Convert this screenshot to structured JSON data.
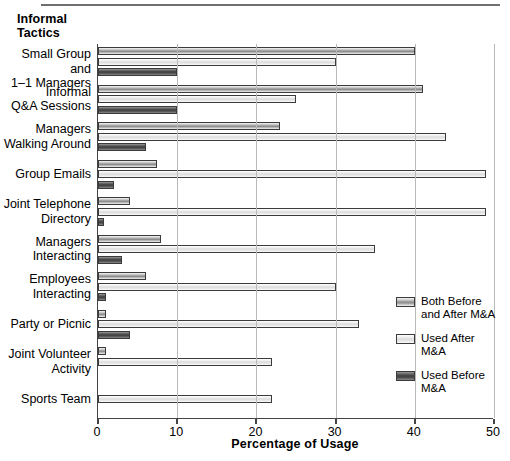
{
  "chart_data": {
    "type": "bar",
    "orientation": "horizontal",
    "title": "",
    "axis_header": "Informal\nTactics",
    "xlabel": "Percentage of Usage",
    "ylabel": "Informal Tactics",
    "xlim": [
      0,
      50
    ],
    "xticks": [
      0,
      10,
      20,
      30,
      40,
      50
    ],
    "grid": "vertical",
    "legend_position": "right-bottom",
    "categories": [
      "Small Group and\n1–1 Managers",
      "Informal\nQ&A Sessions",
      "Managers\nWalking Around",
      "Group Emails",
      "Joint Telephone\nDirectory",
      "Managers\nInteracting",
      "Employees\nInteracting",
      "Party or Picnic",
      "Joint Volunteer\nActivity",
      "Sports Team"
    ],
    "series": [
      {
        "name": "Both Before and After M&A",
        "color": "#9e9e9e",
        "values": [
          40,
          41,
          23,
          7.5,
          4,
          8,
          6,
          1,
          1,
          0
        ]
      },
      {
        "name": "Used After M&A",
        "color": "#e6e6e6",
        "values": [
          30,
          25,
          44,
          49,
          49,
          35,
          30,
          33,
          22,
          22
        ]
      },
      {
        "name": "Used Before M&A",
        "color": "#4a4a4a",
        "values": [
          10,
          10,
          6,
          2,
          0.8,
          3,
          1,
          4,
          0,
          0
        ]
      }
    ]
  },
  "axis_head": {
    "line1": "Informal",
    "line2": "Tactics"
  },
  "categories": [
    {
      "line1": "Small Group and",
      "line2": "1–1 Managers"
    },
    {
      "line1": "Informal",
      "line2": "Q&A Sessions"
    },
    {
      "line1": "Managers",
      "line2": "Walking Around"
    },
    {
      "line1": "Group Emails",
      "line2": ""
    },
    {
      "line1": "Joint Telephone",
      "line2": "Directory"
    },
    {
      "line1": "Managers",
      "line2": "Interacting"
    },
    {
      "line1": "Employees",
      "line2": "Interacting"
    },
    {
      "line1": "Party or Picnic",
      "line2": ""
    },
    {
      "line1": "Joint Volunteer",
      "line2": "Activity"
    },
    {
      "line1": "Sports Team",
      "line2": ""
    }
  ],
  "xticks": [
    {
      "label": "0",
      "value": 0
    },
    {
      "label": "10",
      "value": 10
    },
    {
      "label": "20",
      "value": 20
    },
    {
      "label": "30",
      "value": 30
    },
    {
      "label": "40",
      "value": 40
    },
    {
      "label": "50",
      "value": 50
    }
  ],
  "xaxis_title": "Percentage of Usage",
  "legend": [
    {
      "line1": "Both Before",
      "line2": "and After M&A",
      "swatch": "both"
    },
    {
      "line1": "Used After",
      "line2": "M&A",
      "swatch": "after"
    },
    {
      "line1": "Used Before",
      "line2": "M&A",
      "swatch": "before"
    }
  ]
}
